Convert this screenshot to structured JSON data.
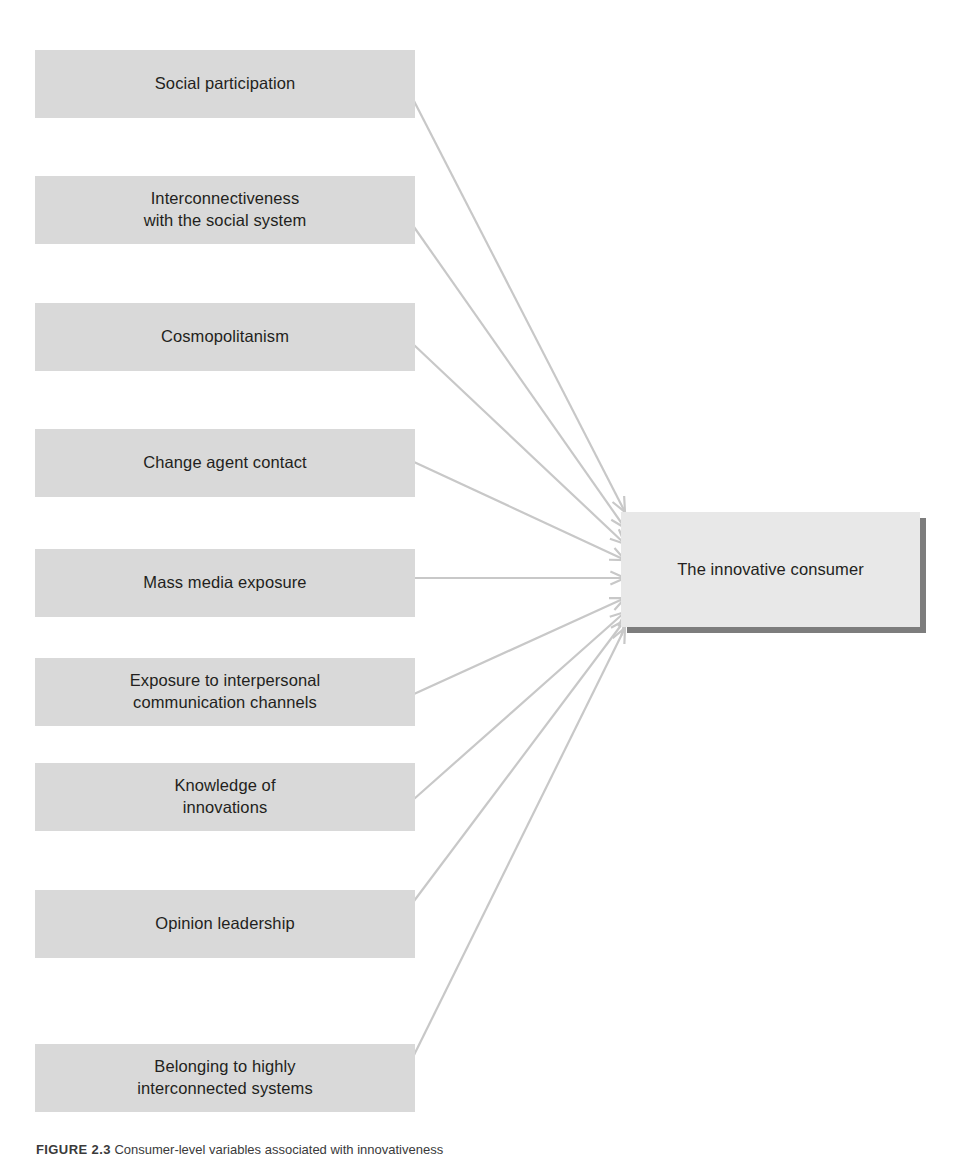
{
  "figure": {
    "center_node": {
      "label": "The innovative consumer",
      "x": 621,
      "y": 512,
      "width": 299,
      "height": 115
    },
    "caption": {
      "code": "FIGURE 2.3",
      "text": "Consumer-level variables associated with innovativeness"
    },
    "colors": {
      "node_fill": "#d9d9d9",
      "center_fill": "#e8e8e8",
      "shadow": "#7d7d7d",
      "connector": "#c8c8c8",
      "text": "#231f20",
      "background": "#ffffff"
    },
    "nodes": [
      {
        "id": "social-participation",
        "label": "Social participation",
        "lines": [
          "Social participation"
        ],
        "x": 35,
        "y": 50,
        "width": 380,
        "height": 68,
        "anchor_x": 414,
        "anchor_y": 101,
        "target_x": 625,
        "target_y": 512
      },
      {
        "id": "interconnectiveness",
        "label": "Interconnectiveness with the social system",
        "lines": [
          "Interconnectiveness",
          "with the social system"
        ],
        "x": 35,
        "y": 176,
        "width": 380,
        "height": 68,
        "anchor_x": 414,
        "anchor_y": 227,
        "target_x": 625,
        "target_y": 528
      },
      {
        "id": "cosmopolitanism",
        "label": "Cosmopolitanism",
        "lines": [
          "Cosmopolitanism"
        ],
        "x": 35,
        "y": 303,
        "width": 380,
        "height": 68,
        "anchor_x": 414,
        "anchor_y": 345,
        "target_x": 625,
        "target_y": 544
      },
      {
        "id": "change-agent-contact",
        "label": "Change agent contact",
        "lines": [
          "Change agent contact"
        ],
        "x": 35,
        "y": 429,
        "width": 380,
        "height": 68,
        "anchor_x": 414,
        "anchor_y": 462,
        "target_x": 625,
        "target_y": 560
      },
      {
        "id": "mass-media-exposure",
        "label": "Mass media exposure",
        "lines": [
          "Mass media exposure"
        ],
        "x": 35,
        "y": 549,
        "width": 380,
        "height": 68,
        "anchor_x": 414,
        "anchor_y": 578,
        "target_x": 625,
        "target_y": 578
      },
      {
        "id": "exposure-interpersonal",
        "label": "Exposure to interpersonal communication channels",
        "lines": [
          "Exposure to interpersonal",
          "communication channels"
        ],
        "x": 35,
        "y": 658,
        "width": 380,
        "height": 68,
        "anchor_x": 414,
        "anchor_y": 694,
        "target_x": 625,
        "target_y": 598
      },
      {
        "id": "knowledge-of-innovations",
        "label": "Knowledge of innovations",
        "lines": [
          "Knowledge of",
          "innovations"
        ],
        "x": 35,
        "y": 763,
        "width": 380,
        "height": 68,
        "anchor_x": 414,
        "anchor_y": 799,
        "target_x": 625,
        "target_y": 612
      },
      {
        "id": "opinion-leadership",
        "label": "Opinion leadership",
        "lines": [
          "Opinion leadership"
        ],
        "x": 35,
        "y": 890,
        "width": 380,
        "height": 68,
        "anchor_x": 414,
        "anchor_y": 901,
        "target_x": 625,
        "target_y": 620
      },
      {
        "id": "belonging-interconnected",
        "label": "Belonging to highly interconnected systems",
        "lines": [
          "Belonging to highly",
          "interconnected systems"
        ],
        "x": 35,
        "y": 1044,
        "width": 380,
        "height": 68,
        "anchor_x": 414,
        "anchor_y": 1055,
        "target_x": 625,
        "target_y": 628
      }
    ]
  }
}
